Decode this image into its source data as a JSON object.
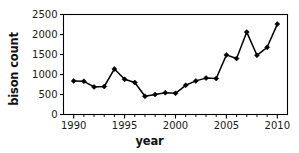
{
  "chart_data": {
    "type": "line",
    "title": "",
    "xlabel": "year",
    "ylabel": "bison count",
    "xlim": [
      1989,
      2011
    ],
    "ylim": [
      0,
      2500
    ],
    "grid": false,
    "legend": null,
    "x": [
      1990,
      1991,
      1992,
      1993,
      1994,
      1995,
      1996,
      1997,
      1998,
      1999,
      2000,
      2001,
      2002,
      2003,
      2004,
      2005,
      2006,
      2007,
      2008,
      2009,
      2010
    ],
    "values": [
      840,
      830,
      690,
      700,
      1140,
      880,
      800,
      455,
      500,
      545,
      530,
      730,
      840,
      910,
      900,
      1490,
      1400,
      2060,
      1480,
      1680,
      2260
    ],
    "series": [
      {
        "name": "bison count",
        "values": [
          840,
          830,
          690,
          700,
          1140,
          880,
          800,
          455,
          500,
          545,
          530,
          730,
          840,
          910,
          900,
          1490,
          1400,
          2060,
          1480,
          1680,
          2260
        ]
      }
    ],
    "xticks_major": [
      1990,
      1995,
      2000,
      2005,
      2010
    ],
    "xticklabels": [
      "1990",
      "1995",
      "2000",
      "2005",
      "2010"
    ],
    "xticks_minor": [
      1991,
      1992,
      1993,
      1994,
      1996,
      1997,
      1998,
      1999,
      2001,
      2002,
      2003,
      2004,
      2006,
      2007,
      2008,
      2009
    ],
    "yticks": [
      0,
      500,
      1000,
      1500,
      2000,
      2500
    ],
    "yticklabels": [
      "0",
      "500",
      "1000",
      "1500",
      "2000",
      "2500"
    ],
    "line_color": "#000000",
    "marker": "diamond",
    "marker_color": "#000000",
    "frame_color": "#000000"
  }
}
